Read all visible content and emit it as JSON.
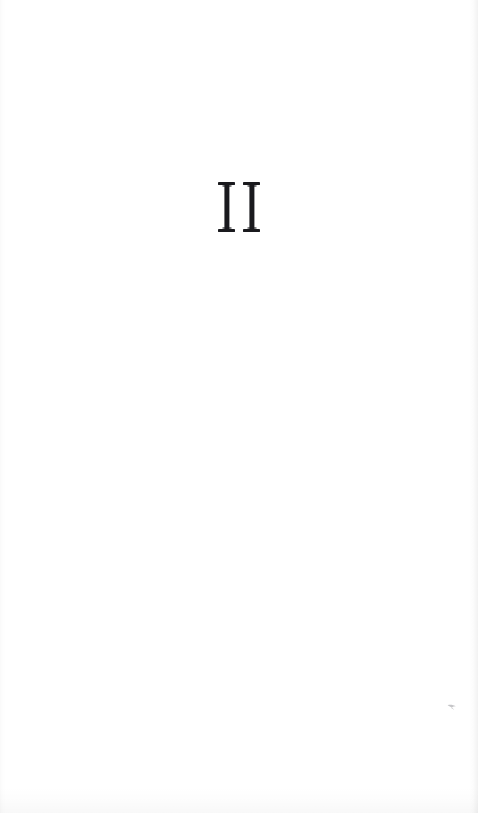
{
  "page": {
    "kind": "book-part-divider",
    "width": 478,
    "height": 813,
    "background_color": "#ffffff",
    "ink_color": "#1a1a1e"
  },
  "content": {
    "part_numeral": "II",
    "numeral_system": "roman",
    "numeral_value": 2,
    "alignment": "center",
    "glyph_count": 2,
    "glyphs": [
      {
        "mark": "I"
      },
      {
        "mark": "I"
      }
    ]
  },
  "artifacts": {
    "right_edge_label": "page-edge-shadow",
    "bottom_edge_label": "page-bottom-shadow",
    "left_edge_label": "page-gutter-shadow",
    "speck_label": "scan-speck"
  }
}
